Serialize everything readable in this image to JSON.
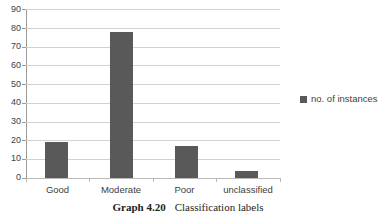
{
  "chart_data": {
    "type": "bar",
    "title": "",
    "xlabel": "",
    "ylabel": "",
    "categories": [
      "Good",
      "Moderate",
      "Poor",
      "unclassified"
    ],
    "values": [
      19,
      78,
      17,
      4
    ],
    "series": [
      {
        "name": "no. of instances",
        "values": [
          19,
          78,
          17,
          4
        ]
      }
    ],
    "ylim": [
      0,
      90
    ],
    "ytick_step": 10,
    "yticks": [
      0,
      10,
      20,
      30,
      40,
      50,
      60,
      70,
      80,
      90
    ],
    "ytick_labels": [
      "0",
      "10",
      "20",
      "30",
      "40",
      "50",
      "60",
      "70",
      "80",
      "90"
    ],
    "grid": true,
    "grid_axis": "y",
    "legend_position": "right",
    "legend_entries": [
      "no. of instances"
    ],
    "bar_color": "#595959",
    "gridline_color": "#d2d2d2",
    "axis_color": "#9a9a9a"
  },
  "legend": {
    "entry_label": "no. of instances"
  },
  "caption": {
    "number": "Graph 4.20",
    "text": "Classification labels"
  }
}
